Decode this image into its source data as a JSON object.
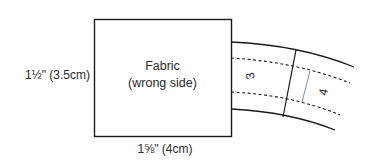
{
  "diagram": {
    "fabric_piece": {
      "title": "Fabric",
      "subtitle": "(wrong side)"
    },
    "dimensions": {
      "height_label": "1½\" (3.5cm)",
      "width_label": "1⅝\" (4cm)"
    },
    "strip": {
      "segments": [
        {
          "number": "3"
        },
        {
          "number": "4"
        }
      ]
    },
    "colors": {
      "line": "#1a1a1a",
      "secondary_line": "#8a8a8a",
      "text": "#2a2a2a",
      "background": "#ffffff"
    }
  }
}
